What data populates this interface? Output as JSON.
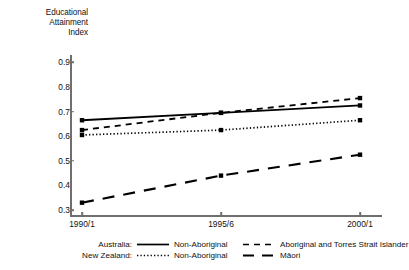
{
  "chart_data": {
    "type": "line",
    "title": "Educational Attainment Index",
    "title_lines": [
      "Educational",
      "Attainment",
      "Index"
    ],
    "xlabel": "",
    "ylabel": "Educational Attainment Index",
    "categories": [
      "1990/1",
      "1995/6",
      "2000/1"
    ],
    "ylim": [
      0.28,
      0.93
    ],
    "yticks": [
      0.3,
      0.4,
      0.5,
      0.6,
      0.7,
      0.8,
      0.9
    ],
    "ytick_labels": [
      "0.3",
      "0.4",
      "0.5",
      "0.6",
      "0.7",
      "0.8",
      "0.9"
    ],
    "grid": false,
    "legend_position": "below",
    "markers": "square",
    "series": [
      {
        "name": "Australia: Non-Aboriginal",
        "short_name": "Non-Aboriginal",
        "country": "Australia:",
        "style": "solid",
        "color": "#000000",
        "values": [
          0.665,
          0.695,
          0.725
        ]
      },
      {
        "name": "Australia: Aboriginal and Torres Strait Islander",
        "short_name": "Aboriginal and Torres Strait Islander",
        "country": "Australia:",
        "style": "dashed-short",
        "color": "#000000",
        "values": [
          0.625,
          0.695,
          0.755
        ]
      },
      {
        "name": "New Zealand: Non-Aboriginal",
        "short_name": "Non-Aboriginal",
        "country": "New Zealand:",
        "style": "dotted",
        "color": "#000000",
        "values": [
          0.605,
          0.625,
          0.665
        ]
      },
      {
        "name": "New Zealand: Māori",
        "short_name": "Māori",
        "country": "New Zealand:",
        "style": "dashed-long",
        "color": "#000000",
        "values": [
          0.33,
          0.44,
          0.525
        ]
      }
    ]
  },
  "legend": {
    "rows": [
      {
        "prefix": "Australia:",
        "left_label": "Non-Aboriginal",
        "right_label": "Aboriginal and Torres Strait Islander"
      },
      {
        "prefix": "New Zealand:",
        "left_label": "Non-Aboriginal",
        "right_label": "Māori"
      }
    ]
  },
  "colors": {
    "axis": "#6f6f6f",
    "ink": "#111111",
    "background": "#ffffff"
  }
}
